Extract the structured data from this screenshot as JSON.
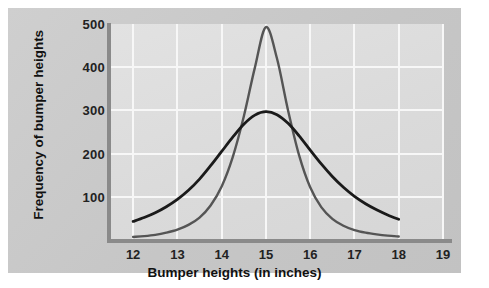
{
  "figure": {
    "panel_color": "#c9c9c9",
    "plot_bg_color": "#dcdcdc",
    "grid_color": "#f7f7f7",
    "axis_color": "#8a8a8a"
  },
  "chart_data": {
    "type": "line",
    "title": "",
    "subtitle": "",
    "xlabel": "Bumper heights (in inches)",
    "ylabel": "Frequency of bumper heights",
    "xlim": [
      11.5,
      19
    ],
    "ylim": [
      0,
      500
    ],
    "xticks": [
      12,
      13,
      14,
      15,
      16,
      17,
      18,
      19
    ],
    "xtick_labels": [
      "12",
      "13",
      "14",
      "15",
      "16",
      "17",
      "18",
      "19"
    ],
    "yticks": [
      100,
      200,
      300,
      400,
      500
    ],
    "ytick_labels": [
      "100",
      "200",
      "300",
      "400",
      "500"
    ],
    "grid": true,
    "grid_axis": "both",
    "legend": false,
    "legend_position": "none",
    "annotations": [],
    "x": [
      12.0,
      12.25,
      12.5,
      12.75,
      13.0,
      13.25,
      13.5,
      13.75,
      14.0,
      14.25,
      14.5,
      14.75,
      15.0,
      15.25,
      15.5,
      15.75,
      16.0,
      16.25,
      16.5,
      16.75,
      17.0,
      17.25,
      17.5,
      17.75,
      18.0
    ],
    "series": [
      {
        "name": "Narrow distribution (tall peak)",
        "color": "#555555",
        "line_width": 2.4,
        "peak_x": 15.0,
        "peak_y": 493,
        "values": [
          7,
          9,
          12,
          17,
          24,
          35,
          52,
          80,
          124,
          192,
          286,
          399,
          493,
          420,
          300,
          196,
          122,
          76,
          49,
          33,
          23,
          17,
          13,
          10,
          8
        ]
      },
      {
        "name": "Wide distribution (broad peak)",
        "color": "#1a1a1a",
        "line_width": 2.8,
        "peak_x": 15.0,
        "peak_y": 297,
        "values": [
          43,
          52,
          63,
          77,
          94,
          115,
          141,
          172,
          205,
          238,
          268,
          289,
          297,
          290,
          270,
          241,
          208,
          176,
          147,
          122,
          101,
          84,
          70,
          58,
          48
        ]
      }
    ],
    "crossings": [
      {
        "x": 14.1,
        "y": 220
      },
      {
        "x": 15.9,
        "y": 212
      }
    ]
  }
}
